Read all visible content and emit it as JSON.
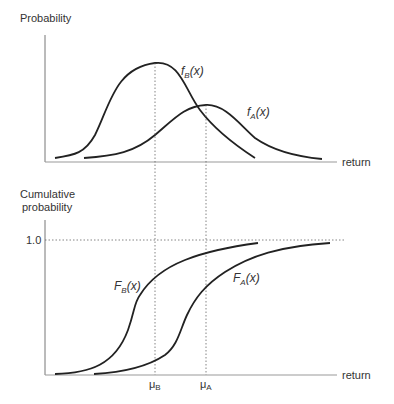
{
  "top_panel": {
    "y_label": "Probability",
    "x_label": "return",
    "curve_b_label": {
      "main": "f",
      "sub": "B",
      "arg": "(x)"
    },
    "curve_a_label": {
      "main": "f",
      "sub": "A",
      "arg": "(x)"
    }
  },
  "bottom_panel": {
    "y_label_line1": "Cumulative",
    "y_label_line2": "probability",
    "y_tick": "1.0",
    "x_label": "return",
    "curve_b_label": {
      "main": "F",
      "sub": "B",
      "arg": "(x)"
    },
    "curve_a_label": {
      "main": "F",
      "sub": "A",
      "arg": "(x)"
    },
    "mu_b": {
      "main": "μ",
      "sub": "B"
    },
    "mu_a": {
      "main": "μ",
      "sub": "A"
    }
  },
  "colors": {
    "curve": "#222222",
    "axis": "#777777",
    "dotted": "#666666"
  }
}
